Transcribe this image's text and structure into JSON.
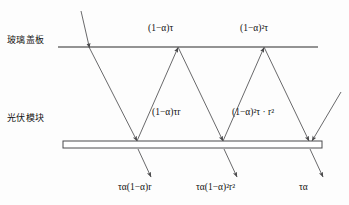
{
  "figure": {
    "layer_labels": {
      "glass_cover": "玻璃盖板",
      "pv_module": "光伏模块"
    },
    "colors": {
      "line": "#6f6f6f",
      "ray": "#58585a",
      "text": "#111111",
      "background": "#fdfdfd"
    },
    "formulas": {
      "top_first_reflection": "(1−α)τ",
      "top_second_reflection": "(1−α)²τ",
      "mid_first": "(1−α)τr",
      "mid_second": "(1−α)²τ · r²",
      "bottom_first": "τα(1−α)r",
      "bottom_second": "τα(1−α)²r²",
      "bottom_third": "τα"
    },
    "geometry": {
      "glass_line": {
        "x1": 58,
        "y": 47,
        "x2": 318
      },
      "module_bar": {
        "x": 63,
        "y": 141,
        "width": 259,
        "height": 7
      },
      "incident_ray": {
        "from": [
          82,
          12
        ],
        "to": [
          89,
          47
        ]
      },
      "vertices_on_glass": [
        89,
        178,
        264
      ],
      "vertices_on_module": [
        137,
        223,
        309
      ],
      "extra_incident_ray": {
        "from": [
          341,
          92
        ],
        "to": [
          312,
          140
        ]
      },
      "transmitted_arrows": [
        {
          "from": [
            139,
            149
          ],
          "to": [
            152,
            176
          ]
        },
        {
          "from": [
            225,
            149
          ],
          "to": [
            238,
            176
          ]
        },
        {
          "from": [
            311,
            149
          ],
          "to": [
            324,
            176
          ]
        }
      ]
    }
  }
}
